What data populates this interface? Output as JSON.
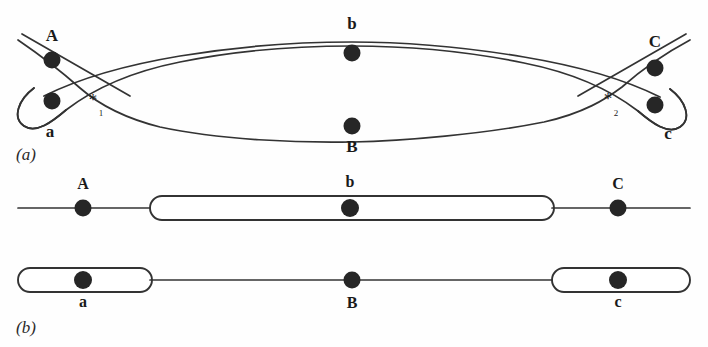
{
  "figure": {
    "background_color": "#fefefe",
    "line_color": "#333333",
    "marker_color": "#262626"
  },
  "panels": [
    {
      "id": "a",
      "label": "(a)",
      "description": "Paired homologous chromosomes forming an inversion loop with two crossover points",
      "markers": [
        {
          "name": "A",
          "label": "A",
          "x": 52,
          "y": 60,
          "label_x": 52,
          "label_y": 41,
          "radius": 8.5
        },
        {
          "name": "a",
          "label": "a",
          "x": 52,
          "y": 101,
          "label_x": 50,
          "label_y": 137,
          "radius": 8.5
        },
        {
          "name": "b",
          "label": "b",
          "x": 352,
          "y": 53,
          "label_x": 352,
          "label_y": 29,
          "radius": 8.5
        },
        {
          "name": "B",
          "label": "B",
          "x": 352,
          "y": 126,
          "label_x": 352,
          "label_y": 152,
          "radius": 8.5
        },
        {
          "name": "C",
          "label": "C",
          "x": 655,
          "y": 68,
          "label_x": 655,
          "label_y": 47,
          "radius": 8.5
        },
        {
          "name": "c",
          "label": "c",
          "x": 655,
          "y": 105,
          "label_x": 668,
          "label_y": 139,
          "radius": 8.5
        }
      ],
      "crossovers": [
        {
          "name": "crossover-1",
          "symbol": "*",
          "subscript": "1",
          "x": 93,
          "y": 105,
          "sub_x": 101,
          "sub_y": 116
        },
        {
          "name": "crossover-2",
          "symbol": "*",
          "subscript": "2",
          "x": 608,
          "y": 104,
          "sub_x": 616,
          "sub_y": 116
        }
      ]
    },
    {
      "id": "b",
      "label": "(b)",
      "description": "Resulting recombinant chromosomes after crossing over within the inversion loop",
      "chromosomes": [
        {
          "name": "upper-chromosome",
          "markers": [
            {
              "name": "A",
              "label": "A",
              "x": 83,
              "y": 208,
              "label_x": 83,
              "label_y": 189,
              "radius": 8.5
            },
            {
              "name": "b",
              "label": "b",
              "x": 350,
              "y": 208,
              "label_x": 350,
              "label_y": 187,
              "radius": 8.5
            },
            {
              "name": "C",
              "label": "C",
              "x": 618,
              "y": 208,
              "label_x": 618,
              "label_y": 189,
              "radius": 8.5
            }
          ]
        },
        {
          "name": "lower-chromosome",
          "markers": [
            {
              "name": "a",
              "label": "a",
              "x": 83,
              "y": 280,
              "label_x": 83,
              "label_y": 307,
              "radius": 8.5
            },
            {
              "name": "B",
              "label": "B",
              "x": 352,
              "y": 280,
              "label_x": 352,
              "label_y": 308,
              "radius": 8.5
            },
            {
              "name": "c",
              "label": "c",
              "x": 618,
              "y": 280,
              "label_x": 618,
              "label_y": 307,
              "radius": 8.5
            }
          ]
        }
      ]
    }
  ],
  "panel_labels": {
    "a": {
      "text": "(a)",
      "x": 16,
      "y": 160
    },
    "b": {
      "text": "(b)",
      "x": 16,
      "y": 333
    }
  }
}
